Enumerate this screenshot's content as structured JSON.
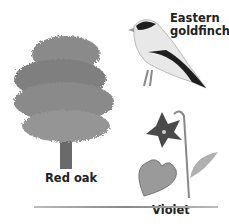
{
  "labels": {
    "bird": [
      "Eastern",
      "goldfinch"
    ],
    "tree": "Red oak",
    "flower": "Violet"
  },
  "colors": {
    "foliage": "#8a8a8a",
    "text": "#222222"
  }
}
